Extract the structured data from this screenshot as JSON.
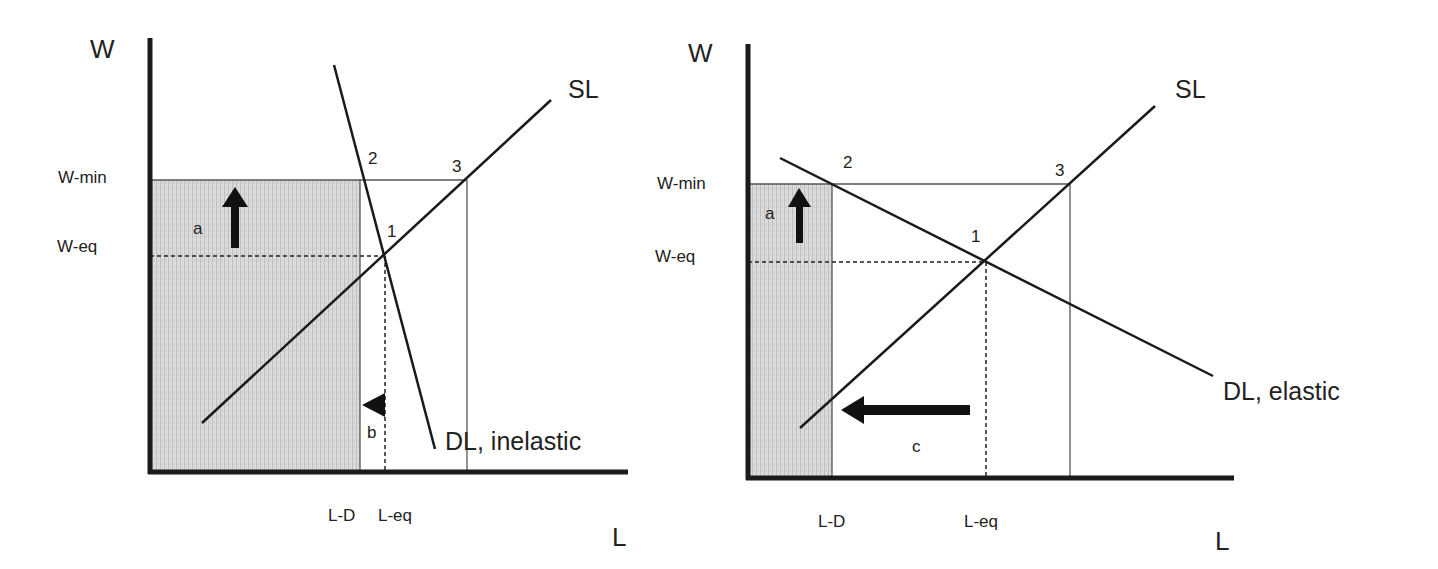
{
  "colors": {
    "axis": "#1a1a1a",
    "curve": "#1a1a1a",
    "thin_line": "#555555",
    "shade": "#d9d9d9",
    "shade_stripe": "#bdbdbd",
    "text": "#222222"
  },
  "left_panel": {
    "y_axis_label": "W",
    "x_axis_label": "L",
    "w_min_label": "W-min",
    "w_eq_label": "W-eq",
    "l_d_label": "L-D",
    "l_eq_label": "L-eq",
    "supply_label": "SL",
    "demand_label": "DL, inelastic",
    "point_1": "1",
    "point_2": "2",
    "point_3": "3",
    "area_a_label": "a",
    "arrow_b_label": "b"
  },
  "right_panel": {
    "y_axis_label": "W",
    "x_axis_label": "L",
    "w_min_label": "W-min",
    "w_eq_label": "W-eq",
    "l_d_label": "L-D",
    "l_eq_label": "L-eq",
    "supply_label": "SL",
    "demand_label": "DL, elastic",
    "point_1": "1",
    "point_2": "2",
    "point_3": "3",
    "area_a_label": "a",
    "arrow_c_label": "c"
  }
}
